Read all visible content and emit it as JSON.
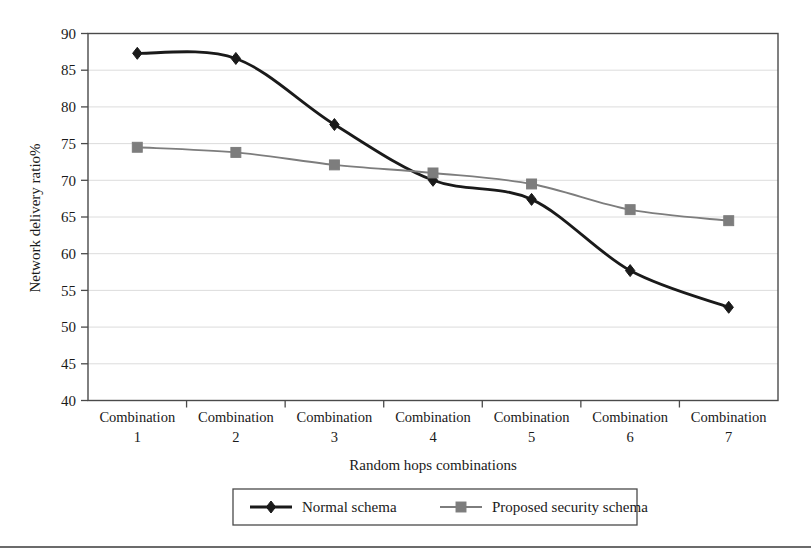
{
  "chart_data": {
    "type": "line",
    "title": "",
    "xlabel": "Random hops combinations",
    "ylabel": "Network delivery ratio%",
    "categories": [
      "Combination 1",
      "Combination 2",
      "Combination 3",
      "Combination 4",
      "Combination 5",
      "Combination 6",
      "Combination 7"
    ],
    "category_lines": [
      [
        "Combination",
        "1"
      ],
      [
        "Combination",
        "2"
      ],
      [
        "Combination",
        "3"
      ],
      [
        "Combination",
        "4"
      ],
      [
        "Combination",
        "5"
      ],
      [
        "Combination",
        "6"
      ],
      [
        "Combination",
        "7"
      ]
    ],
    "ylim": [
      40,
      90
    ],
    "yticks": [
      40,
      45,
      50,
      55,
      60,
      65,
      70,
      75,
      80,
      85,
      90
    ],
    "ytick_labels": [
      "40",
      "45",
      "50",
      "55",
      "60",
      "65",
      "70",
      "75",
      "80",
      "85",
      "90"
    ],
    "grid": true,
    "grid_axis": "y",
    "legend_position": "bottom",
    "series": [
      {
        "name": "Normal schema",
        "marker": "diamond",
        "color": "#1a1a1a",
        "values": [
          87.3,
          86.6,
          77.6,
          70.0,
          67.4,
          57.7,
          52.7
        ]
      },
      {
        "name": "Proposed security schema",
        "marker": "square",
        "color": "#7d7d7d",
        "values": [
          74.5,
          73.8,
          72.1,
          71.0,
          69.5,
          66.0,
          64.5
        ]
      }
    ]
  },
  "legend": {
    "items": [
      {
        "label": "Normal schema",
        "marker": "diamond",
        "color": "#1a1a1a"
      },
      {
        "label": "Proposed security schema",
        "marker": "square",
        "color": "#7d7d7d"
      }
    ]
  },
  "colors": {
    "normal_schema": "#1a1a1a",
    "proposed_schema": "#7d7d7d",
    "grid": "#d8d8d8",
    "frame": "#4a4a4a",
    "rule": "#3a3a3a"
  }
}
